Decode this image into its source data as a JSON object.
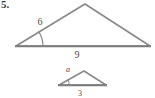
{
  "figure": {
    "problem_number": "5.",
    "large_triangle": {
      "name": "large-triangle",
      "side_label": "6",
      "base_label": "9",
      "has_angle_arc": true,
      "vertices": {
        "left": [
          16,
          46
        ],
        "apex": [
          85,
          4
        ],
        "right": [
          150,
          46
        ]
      },
      "label_positions": {
        "side": [
          40,
          24
        ],
        "base": [
          77,
          57
        ]
      },
      "angle_arc": {
        "center": [
          16,
          46
        ],
        "radius": 26,
        "start_deg": 0,
        "end_deg": 31
      }
    },
    "small_triangle": {
      "name": "small-triangle",
      "side_label": "a",
      "base_label": "3",
      "has_angle_arc": true,
      "vertices": {
        "left": [
          59,
          85
        ],
        "apex": [
          84,
          72
        ],
        "right": [
          106,
          85
        ]
      },
      "label_positions": {
        "side": [
          68,
          70
        ],
        "base": [
          80,
          96
        ]
      },
      "angle_arc": {
        "center": [
          59,
          85
        ],
        "radius": 10,
        "start_deg": 0,
        "end_deg": 28
      }
    },
    "colors": {
      "stroke": "#8a8a8a",
      "stroke_dark": "#6f6f6f",
      "text": "#4a4a4a",
      "number": "#3c3c3c",
      "background": "#ffffff"
    },
    "stroke_width": 1.6
  }
}
